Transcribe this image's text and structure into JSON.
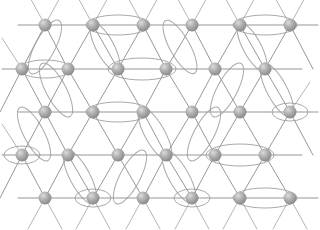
{
  "figure": {
    "type": "lattice-diagram",
    "width": 320,
    "height": 230,
    "background_color": "#ffffff"
  },
  "style": {
    "bond_color": "#8c8c8c",
    "bond_color_light": "#a8a8a8",
    "bond_width": 1.0,
    "ellipse_color": "#9d9d9d",
    "ellipse_width": 1.0,
    "node_radius": 6.5,
    "node_color_light": "#d8d8d8",
    "node_color_mid": "#a9a9a9",
    "node_color_dark": "#8a8a8a",
    "node_outline": "#7f7f7f"
  },
  "lattice": {
    "description": "Triangular lattice: 5 horizontal rows of sites, alternating rows offset horizontally; sites joined by horizontal and diagonal bonds.",
    "rows": 5,
    "row_y": [
      25,
      69,
      112,
      155,
      198
    ],
    "row_spacing": 43,
    "column_spacing": 49,
    "row_offset_odd": 45,
    "row_offset_even": 22,
    "nodes": [
      {
        "id": "n-0-0",
        "row": 0,
        "col": 0,
        "x": 45,
        "y": 25
      },
      {
        "id": "n-0-1",
        "row": 0,
        "col": 1,
        "x": 93,
        "y": 25
      },
      {
        "id": "n-0-2",
        "row": 0,
        "col": 2,
        "x": 143,
        "y": 25
      },
      {
        "id": "n-0-3",
        "row": 0,
        "col": 3,
        "x": 192,
        "y": 25
      },
      {
        "id": "n-0-4",
        "row": 0,
        "col": 4,
        "x": 240,
        "y": 25
      },
      {
        "id": "n-0-5",
        "row": 0,
        "col": 5,
        "x": 290,
        "y": 25
      },
      {
        "id": "n-1-0",
        "row": 1,
        "col": 0,
        "x": 22,
        "y": 69
      },
      {
        "id": "n-1-1",
        "row": 1,
        "col": 1,
        "x": 68,
        "y": 69
      },
      {
        "id": "n-1-2",
        "row": 1,
        "col": 2,
        "x": 118,
        "y": 69
      },
      {
        "id": "n-1-3",
        "row": 1,
        "col": 3,
        "x": 166,
        "y": 69
      },
      {
        "id": "n-1-4",
        "row": 1,
        "col": 4,
        "x": 215,
        "y": 69
      },
      {
        "id": "n-1-5",
        "row": 1,
        "col": 5,
        "x": 265,
        "y": 69
      },
      {
        "id": "n-2-0",
        "row": 2,
        "col": 0,
        "x": 45,
        "y": 112
      },
      {
        "id": "n-2-1",
        "row": 2,
        "col": 1,
        "x": 93,
        "y": 112
      },
      {
        "id": "n-2-2",
        "row": 2,
        "col": 2,
        "x": 143,
        "y": 112
      },
      {
        "id": "n-2-3",
        "row": 2,
        "col": 3,
        "x": 192,
        "y": 112
      },
      {
        "id": "n-2-4",
        "row": 2,
        "col": 4,
        "x": 240,
        "y": 112
      },
      {
        "id": "n-2-5",
        "row": 2,
        "col": 5,
        "x": 290,
        "y": 112
      },
      {
        "id": "n-3-0",
        "row": 3,
        "col": 0,
        "x": 22,
        "y": 155
      },
      {
        "id": "n-3-1",
        "row": 3,
        "col": 1,
        "x": 68,
        "y": 155
      },
      {
        "id": "n-3-2",
        "row": 3,
        "col": 2,
        "x": 118,
        "y": 155
      },
      {
        "id": "n-3-3",
        "row": 3,
        "col": 3,
        "x": 166,
        "y": 155
      },
      {
        "id": "n-3-4",
        "row": 3,
        "col": 4,
        "x": 215,
        "y": 155
      },
      {
        "id": "n-3-5",
        "row": 3,
        "col": 5,
        "x": 265,
        "y": 155
      },
      {
        "id": "n-4-0",
        "row": 4,
        "col": 0,
        "x": 45,
        "y": 198
      },
      {
        "id": "n-4-1",
        "row": 4,
        "col": 1,
        "x": 93,
        "y": 198
      },
      {
        "id": "n-4-2",
        "row": 4,
        "col": 2,
        "x": 143,
        "y": 198
      },
      {
        "id": "n-4-3",
        "row": 4,
        "col": 3,
        "x": 192,
        "y": 198
      },
      {
        "id": "n-4-4",
        "row": 4,
        "col": 4,
        "x": 240,
        "y": 198
      },
      {
        "id": "n-4-5",
        "row": 4,
        "col": 5,
        "x": 290,
        "y": 198
      }
    ],
    "horizontal_lines": [
      {
        "id": "h-row-0",
        "y": 25,
        "x1": 18,
        "x2": 318
      },
      {
        "id": "h-row-1",
        "y": 69,
        "x1": 2,
        "x2": 302
      },
      {
        "id": "h-row-2",
        "y": 112,
        "x1": 18,
        "x2": 318
      },
      {
        "id": "h-row-3",
        "y": 155,
        "x1": 2,
        "x2": 302
      },
      {
        "id": "h-row-4",
        "y": 198,
        "x1": 18,
        "x2": 318
      }
    ],
    "diagonal_bonds": [
      {
        "x1": 45,
        "y1": 25,
        "x2": 22,
        "y2": 69
      },
      {
        "x1": 45,
        "y1": 25,
        "x2": 68,
        "y2": 69
      },
      {
        "x1": 93,
        "y1": 25,
        "x2": 68,
        "y2": 69
      },
      {
        "x1": 93,
        "y1": 25,
        "x2": 118,
        "y2": 69
      },
      {
        "x1": 143,
        "y1": 25,
        "x2": 118,
        "y2": 69
      },
      {
        "x1": 143,
        "y1": 25,
        "x2": 166,
        "y2": 69
      },
      {
        "x1": 192,
        "y1": 25,
        "x2": 166,
        "y2": 69
      },
      {
        "x1": 192,
        "y1": 25,
        "x2": 215,
        "y2": 69
      },
      {
        "x1": 240,
        "y1": 25,
        "x2": 215,
        "y2": 69
      },
      {
        "x1": 240,
        "y1": 25,
        "x2": 265,
        "y2": 69
      },
      {
        "x1": 290,
        "y1": 25,
        "x2": 265,
        "y2": 69
      },
      {
        "x1": 290,
        "y1": 25,
        "x2": 313,
        "y2": 69
      },
      {
        "x1": 22,
        "y1": 69,
        "x2": 45,
        "y2": 112
      },
      {
        "x1": 68,
        "y1": 69,
        "x2": 45,
        "y2": 112
      },
      {
        "x1": 68,
        "y1": 69,
        "x2": 93,
        "y2": 112
      },
      {
        "x1": 118,
        "y1": 69,
        "x2": 93,
        "y2": 112
      },
      {
        "x1": 118,
        "y1": 69,
        "x2": 143,
        "y2": 112
      },
      {
        "x1": 166,
        "y1": 69,
        "x2": 143,
        "y2": 112
      },
      {
        "x1": 166,
        "y1": 69,
        "x2": 192,
        "y2": 112
      },
      {
        "x1": 215,
        "y1": 69,
        "x2": 192,
        "y2": 112
      },
      {
        "x1": 215,
        "y1": 69,
        "x2": 240,
        "y2": 112
      },
      {
        "x1": 265,
        "y1": 69,
        "x2": 240,
        "y2": 112
      },
      {
        "x1": 265,
        "y1": 69,
        "x2": 290,
        "y2": 112
      },
      {
        "x1": 22,
        "y1": 69,
        "x2": 0,
        "y2": 112
      },
      {
        "x1": 45,
        "y1": 112,
        "x2": 22,
        "y2": 155
      },
      {
        "x1": 45,
        "y1": 112,
        "x2": 68,
        "y2": 155
      },
      {
        "x1": 93,
        "y1": 112,
        "x2": 68,
        "y2": 155
      },
      {
        "x1": 93,
        "y1": 112,
        "x2": 118,
        "y2": 155
      },
      {
        "x1": 143,
        "y1": 112,
        "x2": 118,
        "y2": 155
      },
      {
        "x1": 143,
        "y1": 112,
        "x2": 166,
        "y2": 155
      },
      {
        "x1": 192,
        "y1": 112,
        "x2": 166,
        "y2": 155
      },
      {
        "x1": 192,
        "y1": 112,
        "x2": 215,
        "y2": 155
      },
      {
        "x1": 240,
        "y1": 112,
        "x2": 215,
        "y2": 155
      },
      {
        "x1": 240,
        "y1": 112,
        "x2": 265,
        "y2": 155
      },
      {
        "x1": 290,
        "y1": 112,
        "x2": 265,
        "y2": 155
      },
      {
        "x1": 290,
        "y1": 112,
        "x2": 313,
        "y2": 155
      },
      {
        "x1": 22,
        "y1": 155,
        "x2": 45,
        "y2": 198
      },
      {
        "x1": 68,
        "y1": 155,
        "x2": 45,
        "y2": 198
      },
      {
        "x1": 68,
        "y1": 155,
        "x2": 93,
        "y2": 198
      },
      {
        "x1": 118,
        "y1": 155,
        "x2": 93,
        "y2": 198
      },
      {
        "x1": 118,
        "y1": 155,
        "x2": 143,
        "y2": 198
      },
      {
        "x1": 166,
        "y1": 155,
        "x2": 143,
        "y2": 198
      },
      {
        "x1": 166,
        "y1": 155,
        "x2": 192,
        "y2": 198
      },
      {
        "x1": 215,
        "y1": 155,
        "x2": 192,
        "y2": 198
      },
      {
        "x1": 215,
        "y1": 155,
        "x2": 240,
        "y2": 198
      },
      {
        "x1": 265,
        "y1": 155,
        "x2": 240,
        "y2": 198
      },
      {
        "x1": 265,
        "y1": 155,
        "x2": 290,
        "y2": 198
      },
      {
        "x1": 22,
        "y1": 155,
        "x2": 0,
        "y2": 198
      }
    ],
    "edge_stubs": [
      {
        "x1": 45,
        "y1": 25,
        "x2": 28,
        "y2": -6
      },
      {
        "x1": 45,
        "y1": 25,
        "x2": 62,
        "y2": -6
      },
      {
        "x1": 93,
        "y1": 25,
        "x2": 76,
        "y2": -6
      },
      {
        "x1": 93,
        "y1": 25,
        "x2": 110,
        "y2": -6
      },
      {
        "x1": 143,
        "y1": 25,
        "x2": 126,
        "y2": -6
      },
      {
        "x1": 143,
        "y1": 25,
        "x2": 160,
        "y2": -6
      },
      {
        "x1": 192,
        "y1": 25,
        "x2": 175,
        "y2": -6
      },
      {
        "x1": 192,
        "y1": 25,
        "x2": 209,
        "y2": -6
      },
      {
        "x1": 240,
        "y1": 25,
        "x2": 223,
        "y2": -6
      },
      {
        "x1": 240,
        "y1": 25,
        "x2": 257,
        "y2": -6
      },
      {
        "x1": 290,
        "y1": 25,
        "x2": 273,
        "y2": -6
      },
      {
        "x1": 290,
        "y1": 25,
        "x2": 307,
        "y2": -6
      },
      {
        "x1": 45,
        "y1": 198,
        "x2": 28,
        "y2": 229
      },
      {
        "x1": 45,
        "y1": 198,
        "x2": 62,
        "y2": 229
      },
      {
        "x1": 93,
        "y1": 198,
        "x2": 76,
        "y2": 229
      },
      {
        "x1": 93,
        "y1": 198,
        "x2": 110,
        "y2": 229
      },
      {
        "x1": 143,
        "y1": 198,
        "x2": 126,
        "y2": 229
      },
      {
        "x1": 143,
        "y1": 198,
        "x2": 160,
        "y2": 229
      },
      {
        "x1": 192,
        "y1": 198,
        "x2": 175,
        "y2": 229
      },
      {
        "x1": 192,
        "y1": 198,
        "x2": 209,
        "y2": 229
      },
      {
        "x1": 240,
        "y1": 198,
        "x2": 223,
        "y2": 229
      },
      {
        "x1": 240,
        "y1": 198,
        "x2": 257,
        "y2": 229
      },
      {
        "x1": 290,
        "y1": 198,
        "x2": 273,
        "y2": 229
      },
      {
        "x1": 290,
        "y1": 198,
        "x2": 307,
        "y2": 229
      },
      {
        "x1": 22,
        "y1": 69,
        "x2": 2,
        "y2": 38
      },
      {
        "x1": 22,
        "y1": 155,
        "x2": 2,
        "y2": 124
      },
      {
        "x1": 290,
        "y1": 112,
        "x2": 310,
        "y2": 82
      }
    ],
    "dimers": [
      {
        "id": "d-01",
        "orientation": "horizontal",
        "cx": 118,
        "cy": 25,
        "rx": 32,
        "ry": 10,
        "angle": 0,
        "node_a": "n-0-1",
        "node_b": "n-0-2"
      },
      {
        "id": "d-02",
        "orientation": "horizontal",
        "cx": 265,
        "cy": 25,
        "rx": 32,
        "ry": 10,
        "angle": 0,
        "node_a": "n-0-4",
        "node_b": "n-0-5"
      },
      {
        "id": "d-03",
        "orientation": "diagonal",
        "cx": 45,
        "cy": 47,
        "rx": 30,
        "ry": 10,
        "angle": -62,
        "node_a": "n-0-0",
        "node_b": "n-1-0"
      },
      {
        "id": "d-04",
        "orientation": "diagonal",
        "cx": 180,
        "cy": 47,
        "rx": 30,
        "ry": 10,
        "angle": 61,
        "node_a": "n-0-3",
        "node_b": "n-1-3"
      },
      {
        "id": "d-05",
        "orientation": "horizontal",
        "cx": 142,
        "cy": 69,
        "rx": 34,
        "ry": 11,
        "angle": 0,
        "node_a": "n-1-2",
        "node_b": "n-1-3"
      },
      {
        "id": "d-06",
        "orientation": "diagonal",
        "cx": 56,
        "cy": 90,
        "rx": 30,
        "ry": 10,
        "angle": 62,
        "node_a": "n-1-1",
        "node_b": "n-2-1"
      },
      {
        "id": "d-07",
        "orientation": "diagonal",
        "cx": 277,
        "cy": 90,
        "rx": 30,
        "ry": 10,
        "angle": 62,
        "node_a": "n-1-5",
        "node_b": "n-2-5"
      },
      {
        "id": "d-08",
        "orientation": "diagonal",
        "cx": 227,
        "cy": 90,
        "rx": 30,
        "ry": 10,
        "angle": -62,
        "node_a": "n-1-4",
        "node_b": "n-2-3"
      },
      {
        "id": "d-09",
        "orientation": "horizontal",
        "cx": 118,
        "cy": 112,
        "rx": 32,
        "ry": 10,
        "angle": 0,
        "node_a": "n-2-1",
        "node_b": "n-2-2"
      },
      {
        "id": "d-10",
        "orientation": "diagonal",
        "cx": 155,
        "cy": 134,
        "rx": 30,
        "ry": 10,
        "angle": 61,
        "node_a": "n-2-2",
        "node_b": "n-3-3"
      },
      {
        "id": "d-11",
        "orientation": "diagonal",
        "cx": 34,
        "cy": 134,
        "rx": 30,
        "ry": 10,
        "angle": 62,
        "node_a": "n-2-0",
        "node_b": "n-3-0"
      },
      {
        "id": "d-12",
        "orientation": "diagonal",
        "cx": 204,
        "cy": 134,
        "rx": 30,
        "ry": 10,
        "angle": -62,
        "node_a": "n-2-3",
        "node_b": "n-3-3"
      },
      {
        "id": "d-13",
        "orientation": "horizontal",
        "cx": 240,
        "cy": 155,
        "rx": 34,
        "ry": 11,
        "angle": 0,
        "node_a": "n-3-4",
        "node_b": "n-3-5"
      },
      {
        "id": "d-14",
        "orientation": "diagonal",
        "cx": 80,
        "cy": 177,
        "rx": 30,
        "ry": 10,
        "angle": 62,
        "node_a": "n-3-1",
        "node_b": "n-4-1"
      },
      {
        "id": "d-15",
        "orientation": "diagonal",
        "cx": 130,
        "cy": 177,
        "rx": 30,
        "ry": 10,
        "angle": -62,
        "node_a": "n-3-2",
        "node_b": "n-4-1"
      },
      {
        "id": "d-16",
        "orientation": "diagonal",
        "cx": 179,
        "cy": 177,
        "rx": 30,
        "ry": 10,
        "angle": 61,
        "node_a": "n-3-3",
        "node_b": "n-4-3"
      },
      {
        "id": "d-17",
        "orientation": "horizontal",
        "cx": 265,
        "cy": 198,
        "rx": 32,
        "ry": 10,
        "angle": 0,
        "node_a": "n-4-4",
        "node_b": "n-4-5"
      },
      {
        "id": "d-18",
        "orientation": "horizontal",
        "cx": 290,
        "cy": 112,
        "rx": 18,
        "ry": 9,
        "angle": 0,
        "node_a": "n-2-5",
        "node_b": "n-2-5"
      },
      {
        "id": "d-19",
        "orientation": "horizontal",
        "cx": 22,
        "cy": 155,
        "rx": 18,
        "ry": 9,
        "angle": 0,
        "node_a": "n-3-0",
        "node_b": "n-3-0"
      },
      {
        "id": "d-20",
        "orientation": "horizontal",
        "cx": 45,
        "cy": 69,
        "rx": 26,
        "ry": 9,
        "angle": 0,
        "node_a": "n-1-0",
        "node_b": "n-1-1"
      },
      {
        "id": "d-21",
        "orientation": "diagonal",
        "cx": 105,
        "cy": 47,
        "rx": 27,
        "ry": 9,
        "angle": 62,
        "node_a": "n-0-1",
        "node_b": "n-1-2"
      },
      {
        "id": "d-22",
        "orientation": "diagonal",
        "cx": 252,
        "cy": 47,
        "rx": 27,
        "ry": 9,
        "angle": 62,
        "node_a": "n-0-4",
        "node_b": "n-1-5"
      },
      {
        "id": "d-23",
        "orientation": "horizontal",
        "cx": 93,
        "cy": 198,
        "rx": 18,
        "ry": 9,
        "angle": 0,
        "node_a": "n-4-1",
        "node_b": "n-4-1"
      },
      {
        "id": "d-24",
        "orientation": "horizontal",
        "cx": 192,
        "cy": 198,
        "rx": 18,
        "ry": 9,
        "angle": 0,
        "node_a": "n-4-3",
        "node_b": "n-4-3"
      }
    ]
  }
}
